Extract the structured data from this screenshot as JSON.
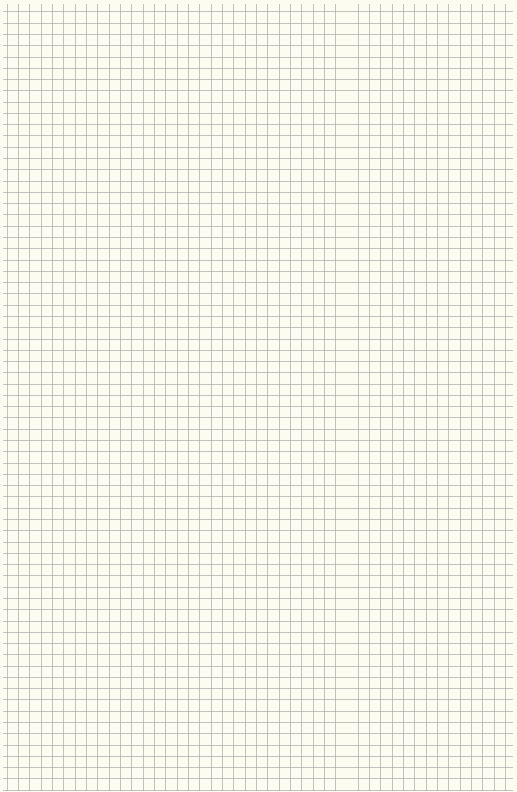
{
  "page": {
    "type": "graph-paper",
    "background_color": "#fcfcf1",
    "grid": {
      "line_color": "#a8a8a8",
      "cell_size_px": 11.3,
      "columns": 45,
      "rows": 69,
      "major_lines": false
    }
  }
}
